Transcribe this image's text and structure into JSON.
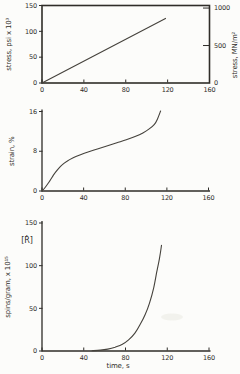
{
  "page": {
    "background": "#fcfcfa",
    "ink": "#2f2d29",
    "curve_color": "#45423c"
  },
  "chart_data": [
    {
      "type": "line",
      "id": "stress-vs-time",
      "title": "",
      "xlabel": "",
      "ylabel": "stress, psi x 10³",
      "y2label": "stress,  MN/m²",
      "xlim": [
        0,
        160
      ],
      "ylim": [
        0,
        150
      ],
      "y2lim": [
        0,
        1034
      ],
      "xticks": [
        "0",
        "40",
        "80",
        "120",
        "160"
      ],
      "yticks": [
        "0",
        "50",
        "100",
        "150"
      ],
      "y2ticks": [
        "0",
        "500",
        "1000"
      ],
      "frame": "box",
      "grid": false,
      "legend": "none",
      "series": [
        {
          "name": "stress",
          "x": [
            0,
            118
          ],
          "y": [
            0,
            125
          ]
        }
      ]
    },
    {
      "type": "line",
      "id": "strain-vs-time",
      "title": "",
      "xlabel": "",
      "ylabel": "strain, %",
      "xlim": [
        0,
        160
      ],
      "ylim": [
        0,
        16
      ],
      "xticks": [
        "0",
        "40",
        "80",
        "120",
        "160"
      ],
      "yticks": [
        "0",
        "8",
        "16"
      ],
      "frame": "axes",
      "grid": false,
      "legend": "none",
      "series": [
        {
          "name": "strain",
          "x": [
            0,
            3,
            7,
            11,
            15,
            19,
            24,
            30,
            37,
            45,
            54,
            63,
            72,
            81,
            90,
            97,
            103,
            108,
            111,
            114
          ],
          "y": [
            0,
            0.7,
            1.9,
            3.2,
            4.3,
            5.2,
            6.0,
            6.7,
            7.3,
            7.9,
            8.5,
            9.1,
            9.7,
            10.3,
            11.0,
            11.7,
            12.5,
            13.4,
            14.5,
            16.1
          ]
        }
      ]
    },
    {
      "type": "line",
      "id": "spins-vs-time",
      "title": "",
      "xlabel": "time, s",
      "ylabel": "spins/gram, x 10¹⁵",
      "annotation": "[Ṙ]",
      "xlim": [
        0,
        160
      ],
      "ylim": [
        0,
        150
      ],
      "xticks": [
        "0",
        "40",
        "80",
        "120",
        "160"
      ],
      "yticks": [
        "0",
        "50",
        "100",
        "150"
      ],
      "frame": "axes",
      "grid": false,
      "legend": "none",
      "series": [
        {
          "name": "spins-per-gram",
          "x": [
            48,
            56,
            63,
            70,
            77,
            83,
            89,
            94,
            99,
            103,
            107,
            110,
            112.5,
            114.5
          ],
          "y": [
            0.3,
            1,
            2.2,
            4.5,
            8,
            13,
            21,
            31,
            43,
            56,
            74,
            93,
            108,
            124
          ]
        }
      ]
    }
  ]
}
